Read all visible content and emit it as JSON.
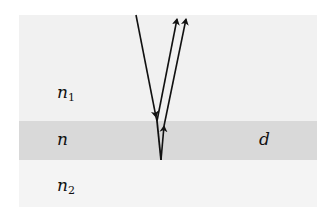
{
  "diagram": {
    "layers": [
      {
        "name": "top-medium",
        "label": "n",
        "subscript": "1",
        "color": "#f1f1f1"
      },
      {
        "name": "film",
        "label": "n",
        "subscript": "",
        "thickness_label": "d",
        "color": "#d9d9d9"
      },
      {
        "name": "bottom-medium",
        "label": "n",
        "subscript": "2",
        "color": "#f4f4f4"
      }
    ],
    "rays": [
      {
        "name": "incident-ray",
        "direction": "down"
      },
      {
        "name": "reflected-ray-top-surface",
        "direction": "up"
      },
      {
        "name": "refracted-ray-in-film",
        "direction": "down"
      },
      {
        "name": "reflected-ray-bottom-surface",
        "direction": "up"
      }
    ],
    "ray_color": "#111111"
  }
}
